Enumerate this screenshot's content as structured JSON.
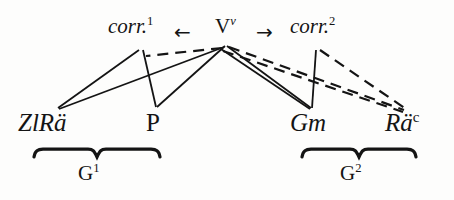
{
  "figure": {
    "type": "linguistic-stemma-diagram",
    "background_color": "#fdfdfc",
    "ink_color": "#141414"
  },
  "nodes": {
    "top": [
      {
        "id": "corr1",
        "base": "corr.",
        "sup": "1",
        "style": "italic",
        "x": 108,
        "y": 16
      },
      {
        "id": "v",
        "base": "V",
        "sup": "v",
        "style": "roman",
        "x": 215,
        "y": 16
      },
      {
        "id": "corr2",
        "base": "corr.",
        "sup": "2",
        "style": "italic",
        "x": 290,
        "y": 16
      }
    ],
    "bottom": [
      {
        "id": "zlrae",
        "base": "ZlRä",
        "sup": "",
        "style": "italic",
        "x": 18,
        "y": 110
      },
      {
        "id": "p",
        "base": "P",
        "sup": "",
        "style": "roman",
        "x": 146,
        "y": 110
      },
      {
        "id": "gm",
        "base": "Gm",
        "sup": "",
        "style": "italic",
        "x": 290,
        "y": 110
      },
      {
        "id": "rae_c",
        "base": "Rä",
        "sup": "c",
        "style": "italic",
        "x": 385,
        "y": 110
      }
    ]
  },
  "arrows": [
    {
      "id": "arrow-left",
      "glyph": "←",
      "x": 174,
      "y": 22
    },
    {
      "id": "arrow-right",
      "glyph": "→",
      "x": 256,
      "y": 22
    }
  ],
  "edges": [
    {
      "id": "corr1-zlrae",
      "from": "corr1",
      "to": "zlrae",
      "style": "solid",
      "x1": 139,
      "y1": 50,
      "x2": 58,
      "y2": 108
    },
    {
      "id": "corr1-p",
      "from": "corr1",
      "to": "p",
      "style": "solid",
      "x1": 143,
      "y1": 50,
      "x2": 156,
      "y2": 107
    },
    {
      "id": "v-zlrae",
      "from": "v",
      "to": "zlrae",
      "style": "solid",
      "x1": 224,
      "y1": 47,
      "x2": 59,
      "y2": 109
    },
    {
      "id": "v-p",
      "from": "v",
      "to": "p",
      "style": "solid",
      "x1": 225,
      "y1": 46,
      "x2": 157,
      "y2": 107
    },
    {
      "id": "v-gm-a",
      "from": "v",
      "to": "gm",
      "style": "solid",
      "x1": 227,
      "y1": 46,
      "x2": 311,
      "y2": 108
    },
    {
      "id": "v-gm-b",
      "from": "v",
      "to": "gm",
      "style": "solid",
      "x1": 221,
      "y1": 49,
      "x2": 310,
      "y2": 109
    },
    {
      "id": "corr2-gm",
      "from": "corr2",
      "to": "gm",
      "style": "solid",
      "x1": 316,
      "y1": 50,
      "x2": 312,
      "y2": 108
    },
    {
      "id": "v-corr1-dash",
      "from": "v",
      "to": "corr1",
      "style": "dashed",
      "x1": 222,
      "y1": 48,
      "x2": 146,
      "y2": 56
    },
    {
      "id": "v-rae-a",
      "from": "v",
      "to": "rae_c",
      "style": "dashed",
      "x1": 229,
      "y1": 47,
      "x2": 404,
      "y2": 110
    },
    {
      "id": "v-rae-b",
      "from": "v",
      "to": "rae_c",
      "style": "dashed",
      "x1": 223,
      "y1": 51,
      "x2": 403,
      "y2": 112
    },
    {
      "id": "corr2-rae",
      "from": "corr2",
      "to": "rae_c",
      "style": "dashed",
      "x1": 320,
      "y1": 50,
      "x2": 406,
      "y2": 109
    }
  ],
  "groups": [
    {
      "id": "g1",
      "label": "G",
      "sup": "1",
      "brace_x": 32,
      "brace_y": 146,
      "brace_width": 130,
      "label_x": 78,
      "label_y": 163
    },
    {
      "id": "g2",
      "label": "G",
      "sup": "2",
      "brace_x": 300,
      "brace_y": 146,
      "brace_width": 118,
      "label_x": 340,
      "label_y": 163
    }
  ]
}
